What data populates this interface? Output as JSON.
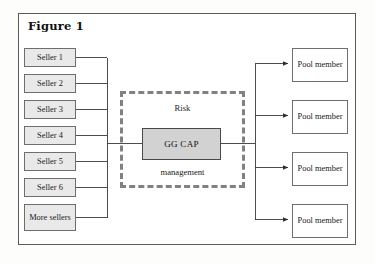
{
  "figure": {
    "title": "Figure 1",
    "frame_color": "#5b5b5b",
    "background": "#ffffff"
  },
  "diagram": {
    "type": "flow-diagram",
    "sellers": [
      {
        "label": "Seller 1",
        "x": 24,
        "y": 48,
        "h": 19
      },
      {
        "label": "Seller 2",
        "x": 24,
        "y": 74,
        "h": 19
      },
      {
        "label": "Seller 3",
        "x": 24,
        "y": 100,
        "h": 19
      },
      {
        "label": "Seller 4",
        "x": 24,
        "y": 126,
        "h": 19
      },
      {
        "label": "Seller 5",
        "x": 24,
        "y": 152,
        "h": 19
      },
      {
        "label": "Seller 6",
        "x": 24,
        "y": 178,
        "h": 19
      },
      {
        "label": "More sellers",
        "x": 24,
        "y": 204,
        "h": 27
      }
    ],
    "center": {
      "dashed_label_top": "Risk",
      "dashed_label_bottom": "management",
      "core_label": "GG CAP",
      "core_fill": "#d2d2d2",
      "dash_color": "#818181"
    },
    "pool_members": [
      {
        "label": "Pool member",
        "x": 292,
        "y": 48
      },
      {
        "label": "Pool member",
        "x": 292,
        "y": 100
      },
      {
        "label": "Pool member",
        "x": 292,
        "y": 152
      },
      {
        "label": "Pool member",
        "x": 292,
        "y": 204
      }
    ],
    "wire_color": "#3a3a3a"
  }
}
